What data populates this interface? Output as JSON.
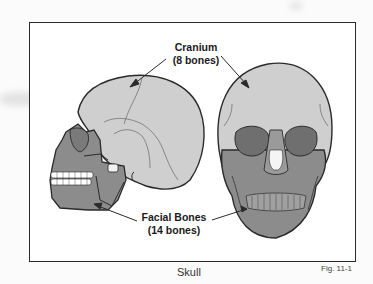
{
  "figure": {
    "title": "Skull",
    "figure_number": "Fig. 11-1",
    "labels": {
      "cranium": {
        "name": "Cranium",
        "count": "(8 bones)"
      },
      "facial": {
        "name": "Facial Bones",
        "count": "(14 bones)"
      }
    },
    "views": [
      "lateral-skull-view",
      "frontal-skull-view"
    ],
    "colors": {
      "cranium_fill": "#cfcfcf",
      "facial_fill": "#8c8c8c",
      "outline": "#2a2a2a",
      "teeth": "#ffffff",
      "frame": "#2a2a2a"
    }
  }
}
